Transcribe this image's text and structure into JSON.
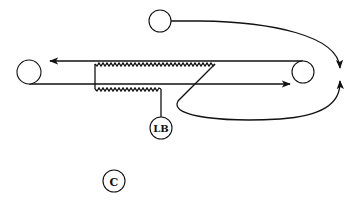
{
  "diagram": {
    "type": "schematic",
    "colors": {
      "line": "#111111",
      "background": "#ffffff"
    },
    "nodes": [
      {
        "id": "left-roller",
        "label": "",
        "cx": 29,
        "cy": 72,
        "r": 12
      },
      {
        "id": "right-roller",
        "label": "",
        "cx": 303,
        "cy": 72,
        "r": 11
      },
      {
        "id": "top-roller",
        "label": "",
        "cx": 160,
        "cy": 21,
        "r": 11
      },
      {
        "id": "lb-node",
        "label": "LB",
        "cx": 161,
        "cy": 128,
        "r": 11
      },
      {
        "id": "c-node",
        "label": "C",
        "cx": 114,
        "cy": 181,
        "r": 11
      }
    ],
    "labels": {
      "lb": "LB",
      "c": "C"
    },
    "edges": [
      {
        "id": "upper-strand",
        "from": "right-roller",
        "to": "left-roller",
        "arrow": "left"
      },
      {
        "id": "lower-strand",
        "from": "left-roller",
        "to": "right-side",
        "arrow": "right"
      },
      {
        "id": "top-feed",
        "from": "top-roller",
        "to": "merge-point",
        "arrow": "down"
      },
      {
        "id": "return-loop",
        "from": "zigzag-end",
        "to": "merge-point",
        "arrow": "up"
      },
      {
        "id": "lb-lead",
        "from": "lower-zigzag",
        "to": "lb-node",
        "arrow": "none"
      }
    ],
    "elements": [
      {
        "id": "upper-zigzag",
        "style": "zigzag"
      },
      {
        "id": "lower-zigzag",
        "style": "zigzag"
      }
    ]
  }
}
